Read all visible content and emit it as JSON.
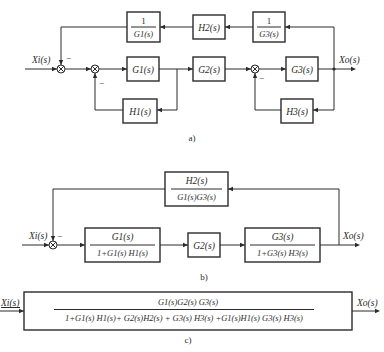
{
  "diagrams": {
    "a": {
      "caption": "a)",
      "input_label": "X_i(s)",
      "input_text": "Xi(s)",
      "output_text": "Xo(s)",
      "blocks": {
        "inv_g1": {
          "num": "1",
          "den": "G1(s)"
        },
        "h2": {
          "label": "H2(s)"
        },
        "inv_g3": {
          "num": "1",
          "den": "G3(s)"
        },
        "g1": {
          "label": "G1(s)"
        },
        "g2": {
          "label": "G2(s)"
        },
        "g3": {
          "label": "G3(s)"
        },
        "h1": {
          "label": "H1(s)"
        },
        "h3": {
          "label": "H3(s)"
        }
      },
      "signs": {
        "sum1_feedback": "−",
        "sum2_feedback": "−",
        "sum3_feedback": "−"
      }
    },
    "b": {
      "caption": "b)",
      "input_text": "Xi(s)",
      "output_text": "Xo(s)",
      "blocks": {
        "feedback": {
          "num": "H2(s)",
          "den": "G1(s)G3(s)"
        },
        "loop1": {
          "num": "G1(s)",
          "den": "1+G1(s) H1(s)"
        },
        "g2": {
          "label": "G2(s)"
        },
        "loop3": {
          "num": "G3(s)",
          "den": "1+G3(s) H3(s)"
        }
      },
      "signs": {
        "sum_feedback": "−"
      }
    },
    "c": {
      "caption": "c)",
      "input_text": "Xi(s)",
      "output_text": "Xo(s)",
      "block": {
        "num": "G1(s)G2(s) G3(s)",
        "den": "1+G1(s) H1(s)+ G2(s)H2(s) + G3(s) H3(s) +G1(s)H1(s) G3(s) H3(s)"
      }
    }
  }
}
